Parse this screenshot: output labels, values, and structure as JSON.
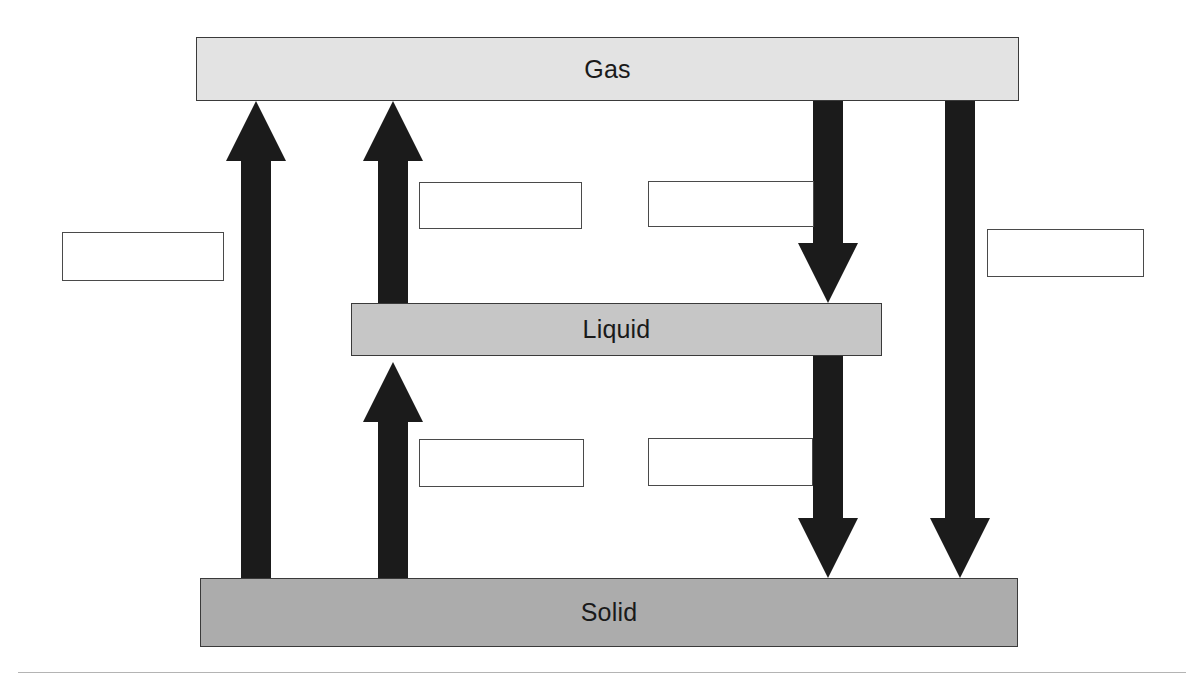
{
  "diagram": {
    "phases": [
      {
        "id": "gas",
        "label": "Gas",
        "fill": "#e3e3e3",
        "border": "#3a3a3a"
      },
      {
        "id": "liquid",
        "label": "Liquid",
        "fill": "#c6c6c6",
        "border": "#3a3a3a"
      },
      {
        "id": "solid",
        "label": "Solid",
        "fill": "#acacac",
        "border": "#3a3a3a"
      }
    ],
    "arrow_color": "#1b1b1b",
    "arrows": [
      {
        "id": "solid-to-gas",
        "direction": "up",
        "from": "solid",
        "to": "gas",
        "label_box": "left"
      },
      {
        "id": "liquid-to-gas",
        "direction": "up",
        "from": "liquid",
        "to": "gas",
        "label_box": "upper-left"
      },
      {
        "id": "solid-to-liquid",
        "direction": "up",
        "from": "solid",
        "to": "liquid",
        "label_box": "lower-left"
      },
      {
        "id": "gas-to-liquid",
        "direction": "down",
        "from": "gas",
        "to": "liquid",
        "label_box": "upper-right"
      },
      {
        "id": "liquid-to-solid",
        "direction": "down",
        "from": "liquid",
        "to": "solid",
        "label_box": "lower-right"
      },
      {
        "id": "gas-to-solid",
        "direction": "down",
        "from": "gas",
        "to": "solid",
        "label_box": "right"
      }
    ],
    "label_boxes": [
      {
        "id": "label-left",
        "value": "",
        "placeholder": ""
      },
      {
        "id": "label-upper-left",
        "value": "",
        "placeholder": ""
      },
      {
        "id": "label-upper-right",
        "value": "",
        "placeholder": ""
      },
      {
        "id": "label-lower-left",
        "value": "",
        "placeholder": ""
      },
      {
        "id": "label-lower-right",
        "value": "",
        "placeholder": ""
      },
      {
        "id": "label-right",
        "value": "",
        "placeholder": ""
      }
    ]
  }
}
